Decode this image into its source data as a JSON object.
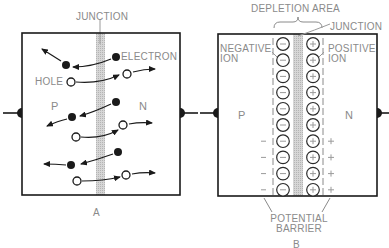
{
  "figure": {
    "panel_a": {
      "caption": "A",
      "labels": {
        "junction": "JUNCTION",
        "electron": "ELECTRON",
        "hole": "HOLE",
        "p_region": "P",
        "n_region": "N"
      }
    },
    "panel_b": {
      "caption": "B",
      "labels": {
        "depletion_area": "DEPLETION AREA",
        "junction": "JUNCTION",
        "negative_ion_1": "NEGATIVE",
        "negative_ion_2": "ION",
        "positive_ion_1": "POSITIVE",
        "positive_ion_2": "ION",
        "p_region": "P",
        "n_region": "N",
        "potential_1": "POTENTIAL",
        "potential_2": "BARRIER"
      },
      "ion_rows": 10,
      "negative_symbol": "−",
      "positive_symbol": "+"
    },
    "colors": {
      "line": "#1a1a1a",
      "label": "#8a8a8a",
      "junction_fill": "#c8c8c8"
    }
  }
}
